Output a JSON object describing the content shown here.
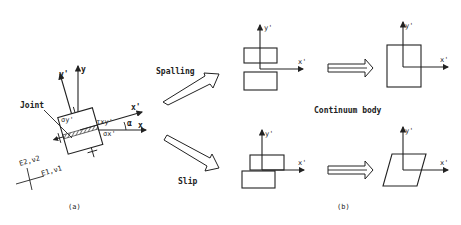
{
  "figure": {
    "panel_a": {
      "caption": "(a)",
      "joint_label": "Joint",
      "axis_y": "y",
      "axis_y_prime": "y'",
      "axis_x": "x",
      "axis_x_prime": "x'",
      "angle_label": "α",
      "sigma_y_label": "σy'",
      "sigma_x_label": "σx'",
      "tau_label": "τxy'",
      "material_2": "E2,ν2",
      "material_1": "E1,ν1"
    },
    "panel_b": {
      "caption": "(b)",
      "spalling_label": "Spalling",
      "slip_label": "Slip",
      "continuum_label": "Continuum body",
      "axis_x_prime": "x'",
      "axis_y_prime": "y'"
    },
    "colors": {
      "ink": "#222222",
      "background": "#ffffff"
    }
  }
}
